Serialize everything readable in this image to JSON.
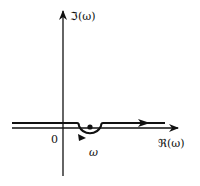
{
  "diagram": {
    "type": "contour-integration-diagram",
    "axes": {
      "imaginary_label": "ℑ(ω)",
      "real_label": "ℜ(ω)",
      "origin_label": "0"
    },
    "pole": {
      "label": "ω"
    },
    "contour": {
      "description": "Horizontal contour slightly above real axis, indented below the pole with a semicircle, directed left to right"
    },
    "colors": {
      "stroke": "#111111",
      "background": "#ffffff"
    }
  }
}
